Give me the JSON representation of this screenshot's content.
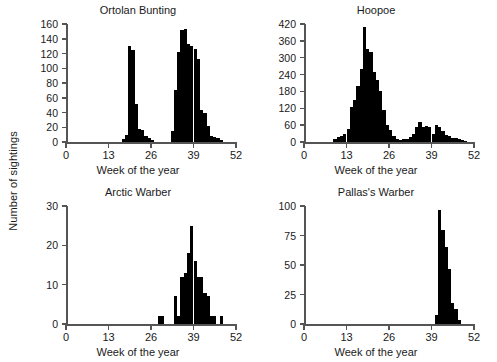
{
  "figure": {
    "y_axis_label": "Number of sightings",
    "x_axis_label": "Week of the year",
    "bar_color": "#000000",
    "axis_color": "#555555"
  },
  "chart_data": [
    {
      "type": "bar",
      "title": "Ortolan Bunting",
      "xlabel": "Week of the year",
      "ylabel": "Number of sightings",
      "xlim": [
        0,
        52
      ],
      "ylim": [
        0,
        160
      ],
      "xticks": [
        0,
        13,
        26,
        39,
        52
      ],
      "yticks": [
        0,
        20,
        40,
        60,
        80,
        100,
        120,
        140,
        160
      ],
      "grid": false,
      "legend": "none",
      "x": [
        17,
        18,
        19,
        20,
        21,
        22,
        23,
        24,
        25,
        26,
        32,
        33,
        34,
        35,
        36,
        37,
        38,
        39,
        40,
        41,
        42,
        43,
        44,
        45,
        46,
        47
      ],
      "values": [
        4,
        10,
        130,
        125,
        52,
        18,
        16,
        8,
        5,
        3,
        15,
        70,
        122,
        152,
        153,
        133,
        130,
        126,
        112,
        44,
        40,
        22,
        8,
        7,
        6,
        3
      ]
    },
    {
      "type": "bar",
      "title": "Hoopoe",
      "xlabel": "Week of the year",
      "ylabel": "Number of sightings",
      "xlim": [
        0,
        52
      ],
      "ylim": [
        0,
        420
      ],
      "xticks": [
        0,
        13,
        26,
        39,
        52
      ],
      "yticks": [
        0,
        60,
        120,
        180,
        240,
        300,
        360,
        420
      ],
      "grid": false,
      "legend": "none",
      "x": [
        9,
        10,
        11,
        12,
        13,
        14,
        15,
        16,
        17,
        18,
        19,
        20,
        21,
        22,
        23,
        24,
        25,
        26,
        27,
        28,
        29,
        30,
        31,
        32,
        33,
        34,
        35,
        36,
        37,
        38,
        39,
        40,
        41,
        42,
        43,
        44,
        45,
        46,
        47,
        48,
        49
      ],
      "values": [
        10,
        18,
        22,
        30,
        48,
        125,
        150,
        200,
        260,
        408,
        330,
        320,
        250,
        220,
        180,
        115,
        60,
        42,
        22,
        10,
        8,
        10,
        12,
        18,
        28,
        55,
        72,
        52,
        58,
        54,
        30,
        60,
        55,
        38,
        25,
        20,
        16,
        14,
        12,
        8,
        4
      ]
    },
    {
      "type": "bar",
      "title": "Arctic Warber",
      "xlabel": "Week of the year",
      "ylabel": "Number of sightings",
      "xlim": [
        0,
        52
      ],
      "ylim": [
        0,
        30
      ],
      "xticks": [
        0,
        13,
        26,
        39,
        52
      ],
      "yticks": [
        0,
        10,
        20,
        30
      ],
      "grid": false,
      "legend": "none",
      "x": [
        28,
        29,
        33,
        34,
        35,
        36,
        37,
        38,
        39,
        40,
        41,
        42,
        43,
        44,
        45,
        47
      ],
      "values": [
        2,
        2,
        7,
        2,
        12,
        13,
        18,
        25,
        16,
        12,
        12,
        8,
        7,
        2,
        2,
        2
      ]
    },
    {
      "type": "bar",
      "title": "Pallas's Warber",
      "xlabel": "Week of the year",
      "ylabel": "Number of sightings",
      "xlim": [
        0,
        52
      ],
      "ylim": [
        0,
        100
      ],
      "xticks": [
        0,
        13,
        26,
        39,
        52
      ],
      "yticks": [
        0,
        25,
        50,
        75,
        100
      ],
      "grid": false,
      "legend": "none",
      "x": [
        40,
        41,
        42,
        43,
        44,
        45,
        46,
        47
      ],
      "values": [
        8,
        97,
        80,
        65,
        47,
        18,
        13,
        3
      ]
    }
  ]
}
